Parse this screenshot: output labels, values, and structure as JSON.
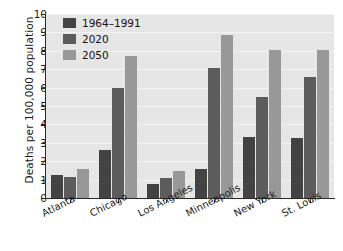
{
  "chart_data": {
    "type": "bar",
    "title": "",
    "xlabel": "",
    "ylabel": "Deaths per 100,000 population",
    "ylim": [
      0,
      10
    ],
    "yticks": [
      0,
      1,
      2,
      3,
      4,
      5,
      6,
      7,
      8,
      9,
      10
    ],
    "grid": true,
    "legend_position": "top-left",
    "categories": [
      "Atlanta",
      "Chicago",
      "Los Angeles",
      "Minneapolis",
      "New York",
      "St. Louis"
    ],
    "series": [
      {
        "name": "1964–1991",
        "color": "#434343",
        "values": [
          1.25,
          2.6,
          0.78,
          1.55,
          3.3,
          3.25
        ]
      },
      {
        "name": "2020",
        "color": "#5c5c5c",
        "values": [
          1.15,
          6.0,
          1.08,
          7.05,
          5.5,
          6.6
        ]
      },
      {
        "name": "2050",
        "color": "#989898",
        "values": [
          1.55,
          7.7,
          1.45,
          8.85,
          8.05,
          8.05
        ]
      }
    ]
  },
  "legend": {
    "items": [
      {
        "label": "1964–1991"
      },
      {
        "label": "2020"
      },
      {
        "label": "2050"
      }
    ]
  },
  "axes": {
    "y_title": "Deaths per 100,000 population"
  }
}
